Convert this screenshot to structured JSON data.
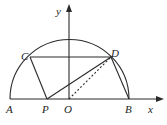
{
  "diagram": {
    "type": "geometry-semicircle",
    "axes": {
      "x_label": "x",
      "y_label": "y",
      "origin_label": "O"
    },
    "points": {
      "A": {
        "label": "A"
      },
      "B": {
        "label": "B"
      },
      "C": {
        "label": "C"
      },
      "D": {
        "label": "D"
      },
      "P": {
        "label": "P"
      },
      "O": {
        "label": "O"
      }
    },
    "segments": [
      {
        "from": "C",
        "to": "D",
        "style": "solid"
      },
      {
        "from": "C",
        "to": "P",
        "style": "solid"
      },
      {
        "from": "P",
        "to": "D",
        "style": "solid"
      },
      {
        "from": "D",
        "to": "B",
        "style": "solid"
      },
      {
        "from": "O",
        "to": "D",
        "style": "dashed"
      },
      {
        "from": "A",
        "to": "B",
        "style": "solid"
      }
    ],
    "arc": {
      "type": "semicircle",
      "center": "O",
      "endpoints": [
        "A",
        "B"
      ]
    }
  }
}
